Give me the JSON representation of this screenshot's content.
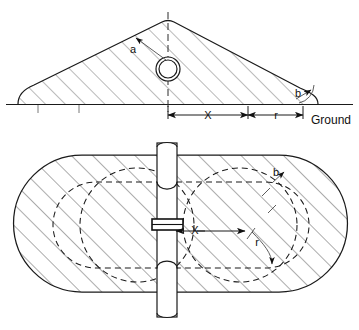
{
  "figure": {
    "views": [
      {
        "name": "side-elevation-view",
        "position": "top"
      },
      {
        "name": "plan-view",
        "position": "bottom"
      }
    ],
    "stroke_color": "#1a1a1a",
    "hatch_color": "#5b5b5b",
    "background": "#ffffff"
  },
  "side_view": {
    "labels": {
      "radius_a": "a",
      "angle_b": "b",
      "dim_x": "X",
      "dim_r": "r",
      "ground": "Ground"
    }
  },
  "plan_view": {
    "labels": {
      "angle_b": "b",
      "dim_x": "X",
      "dim_r": "r"
    }
  }
}
